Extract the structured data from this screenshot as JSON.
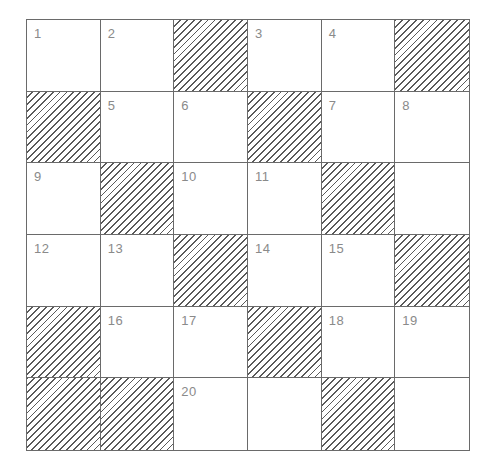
{
  "puzzle": {
    "rows": 6,
    "cols": 6,
    "grid": [
      [
        {
          "n": "1"
        },
        {
          "n": "2"
        },
        {
          "b": true
        },
        {
          "n": "3"
        },
        {
          "n": "4"
        },
        {
          "b": true
        }
      ],
      [
        {
          "b": true
        },
        {
          "n": "5"
        },
        {
          "n": "6"
        },
        {
          "b": true
        },
        {
          "n": "7"
        },
        {
          "n": "8"
        }
      ],
      [
        {
          "n": "9"
        },
        {
          "b": true
        },
        {
          "n": "10"
        },
        {
          "n": "11"
        },
        {
          "b": true
        },
        {
          "n": ""
        }
      ],
      [
        {
          "n": "12"
        },
        {
          "n": "13"
        },
        {
          "b": true
        },
        {
          "n": "14"
        },
        {
          "n": "15"
        },
        {
          "b": true
        }
      ],
      [
        {
          "b": true
        },
        {
          "n": "16"
        },
        {
          "n": "17"
        },
        {
          "b": true
        },
        {
          "n": "18"
        },
        {
          "n": "19"
        }
      ],
      [
        {
          "b": true
        },
        {
          "b": true
        },
        {
          "n": "20"
        },
        {
          "n": ""
        },
        {
          "b": true
        },
        {
          "n": ""
        }
      ]
    ]
  }
}
